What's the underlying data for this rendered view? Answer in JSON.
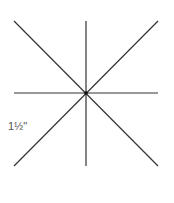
{
  "diagram": {
    "type": "star-of-lines",
    "center": [
      86,
      93
    ],
    "lines": [
      {
        "name": "vertical",
        "x1": 86,
        "y1": 21,
        "x2": 86,
        "y2": 166
      },
      {
        "name": "horizontal",
        "x1": 14,
        "y1": 93,
        "x2": 158,
        "y2": 93
      },
      {
        "name": "diagonal-down",
        "x1": 14,
        "y1": 21,
        "x2": 158,
        "y2": 166
      },
      {
        "name": "diagonal-up",
        "x1": 14,
        "y1": 166,
        "x2": 158,
        "y2": 21
      }
    ],
    "stroke_color": "#333333",
    "label": "1½\""
  }
}
